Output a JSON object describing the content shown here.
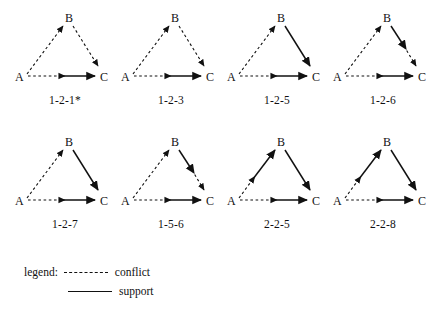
{
  "figure": {
    "nodes": [
      "A",
      "B",
      "C"
    ],
    "row1": [
      {
        "caption": "1-2-1*",
        "edges": {
          "ab": "conflict-arrow-at-B",
          "bc": "conflict-arrow-at-C",
          "ac": "conflict-then-support-arrow-at-C"
        }
      },
      {
        "caption": "1-2-3",
        "edges": {
          "ab": "conflict-arrow-at-B",
          "bc": "conflict-arrow-at-C",
          "ac": "conflict-then-support-arrow-at-C"
        }
      },
      {
        "caption": "1-2-5",
        "edges": {
          "ab": "conflict-arrow-at-B",
          "bc": "support-arrow-at-C",
          "ac": "conflict-then-support-arrow-at-C"
        }
      },
      {
        "caption": "1-2-6",
        "edges": {
          "ab": "conflict-arrow-at-B",
          "bc": "support-then-conflict-two-arrows",
          "ac": "conflict-then-support-arrow-at-C"
        }
      }
    ],
    "row2": [
      {
        "caption": "1-2-7",
        "edges": {
          "ab": "conflict-arrow-at-B",
          "bc": "support-arrow-at-C",
          "ac": "conflict-then-support-arrow-at-C"
        }
      },
      {
        "caption": "1-5-6",
        "edges": {
          "ab": "conflict-arrow-at-B",
          "bc": "support-then-conflict-two-arrows",
          "ac": "conflict-then-support-arrow-at-C"
        }
      },
      {
        "caption": "2-2-5",
        "edges": {
          "ab": "conflict-then-support-two-arrows",
          "bc": "support-arrow-at-C",
          "ac": "conflict-then-support-arrow-at-C"
        }
      },
      {
        "caption": "2-2-8",
        "edges": {
          "ab": "conflict-then-support-two-arrows",
          "bc": "support-arrow-at-C",
          "ac": "conflict-then-support-arrow-at-C"
        }
      }
    ]
  },
  "legend": {
    "label": "legend:",
    "conflict_text": "conflict",
    "support_text": "support"
  },
  "colors": {
    "ink": "#111111",
    "background": "#ffffff"
  }
}
